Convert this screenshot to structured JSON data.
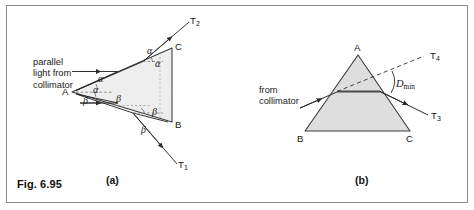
{
  "figure": {
    "number": "Fig. 6.95",
    "panel_a_label": "(a)",
    "panel_b_label": "(b)",
    "border_color": "#8d8d8d",
    "background_color": "#ffffff"
  },
  "panel_a": {
    "caption": "(a)",
    "source_text_line1": "parallel",
    "source_text_line2": "light from",
    "source_text_line3": "collimator",
    "vertices": {
      "a": "A",
      "b": "B",
      "c": "C"
    },
    "rays": {
      "t1": "T",
      "t1_sub": "1",
      "t2": "T",
      "t2_sub": "2"
    },
    "angles": {
      "alpha": "α",
      "beta": "β",
      "alpha_count": 3,
      "beta_count": 4
    },
    "prism_fill": "#eeeeee",
    "prism_stroke": "#3a3a3a"
  },
  "panel_b": {
    "caption": "(b)",
    "source_text_line1": "from",
    "source_text_line2": "collimator",
    "vertices": {
      "a": "A",
      "b": "B",
      "c": "C"
    },
    "rays": {
      "t3": "T",
      "t3_sub": "3",
      "t4": "T",
      "t4_sub": "4"
    },
    "deviation_label": "D",
    "deviation_sub": "min",
    "prism_fill": "#dedede",
    "prism_stroke": "#3a3a3a"
  }
}
